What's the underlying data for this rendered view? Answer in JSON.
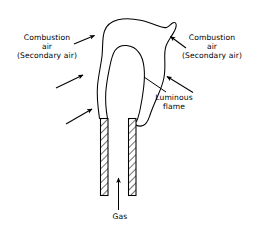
{
  "figure": {
    "background_color": "#ffffff",
    "line_color": "#000000",
    "text_color": "#000000"
  },
  "labels": {
    "combustion_air_left": {
      "line1": "Combustion",
      "line2": "air",
      "line3": "(Secondary air)"
    },
    "combustion_air_right": {
      "line1": "Combustion",
      "line2": "air",
      "line3": "(Secondary air)"
    },
    "luminous_flame": {
      "line1": "Luminous",
      "line2": "flame"
    },
    "gas": {
      "line1": "Gas"
    }
  },
  "parts": {
    "flame_outer": "outer-flame-envelope",
    "flame_inner": "inner-luminous-flame-cone",
    "burner_tube_left": "burner-tube-left",
    "burner_tube_right": "burner-tube-right",
    "gas_arrow": "gas-flow-arrow",
    "air_arrows_left": 3,
    "air_arrows_right": 3
  }
}
